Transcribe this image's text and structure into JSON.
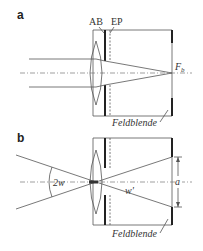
{
  "panel_a": {
    "label": "a",
    "aperture_stop_label": "AB",
    "entrance_pupil_label": "EP",
    "focal_point_label": "F",
    "focal_point_subscript": "b",
    "field_stop_label": "Feldblende"
  },
  "panel_b": {
    "label": "b",
    "field_angle_label": "2w",
    "image_angle_label": "w'",
    "field_stop_size_label": "a",
    "field_stop_label": "Feldblende"
  }
}
